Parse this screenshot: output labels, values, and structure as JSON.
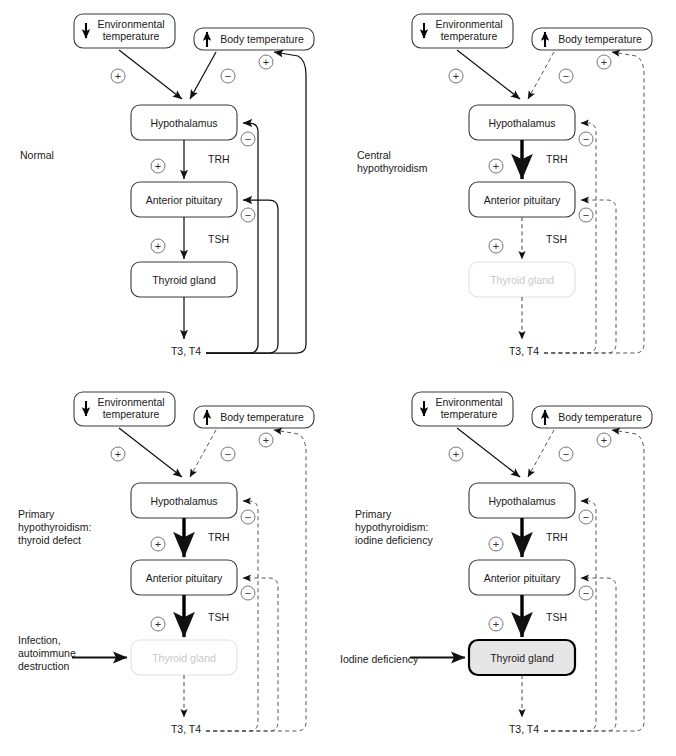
{
  "figure": {
    "panel_count": 4,
    "colors": {
      "ink": "#111111",
      "box_stroke": "#3a3a3a",
      "faded": "#d8d8d8",
      "shaded_fill": "#e6e6e6",
      "dashed": "#555555"
    }
  },
  "common": {
    "environmental_temperature": "Environmental\ntemperature",
    "environmental_line1": "Environmental",
    "environmental_line2": "temperature",
    "environmental_arrow": "down-arrow-icon",
    "body_temperature": "Body temperature",
    "body_arrow": "up-arrow-icon",
    "hypothalamus": "Hypothalamus",
    "anterior_pituitary": "Anterior pituitary",
    "thyroid_gland": "Thyroid gland",
    "trh": "TRH",
    "tsh": "TSH",
    "t3t4": "T3, T4",
    "plus": "+",
    "minus": "−"
  },
  "panels": [
    {
      "id": "normal",
      "label_lines": [
        "Normal"
      ],
      "trh_style": "normal",
      "tsh_style": "normal",
      "t3t4_style": "normal",
      "thyroid_state": "normal",
      "body_temp_state": "active",
      "external_insult": null
    },
    {
      "id": "central-hypothyroidism",
      "label_lines": [
        "Central",
        "hypothyroidism"
      ],
      "trh_style": "bold",
      "tsh_style": "dashed",
      "t3t4_style": "dashed",
      "thyroid_state": "faded",
      "body_temp_state": "dashed",
      "external_insult": null
    },
    {
      "id": "primary-hypothyroidism-thyroid-defect",
      "label_lines": [
        "Primary",
        "hypothyroidism:",
        "thyroid defect"
      ],
      "trh_style": "bold",
      "tsh_style": "bold",
      "t3t4_style": "dashed",
      "thyroid_state": "faded",
      "body_temp_state": "dashed",
      "external_insult": {
        "lines": [
          "Infection,",
          "autoimmune",
          "destruction"
        ],
        "arrow": "solid-arrow-right"
      }
    },
    {
      "id": "primary-hypothyroidism-iodine-deficiency",
      "label_lines": [
        "Primary",
        "hypothyroidism:",
        "iodine deficiency"
      ],
      "trh_style": "bold",
      "tsh_style": "bold",
      "t3t4_style": "dashed",
      "thyroid_state": "shaded",
      "body_temp_state": "dashed",
      "external_insult": {
        "lines": [
          "Iodine deficiency"
        ],
        "arrow": "solid-arrow-right"
      }
    }
  ],
  "signals": {
    "env_to_hypo": "+",
    "body_to_hypo": "−",
    "hypo_to_pit": "+",
    "pit_to_thy": "+",
    "t3t4_to_hypo": "−",
    "t3t4_to_pit": "−",
    "t3t4_to_body": "+"
  }
}
